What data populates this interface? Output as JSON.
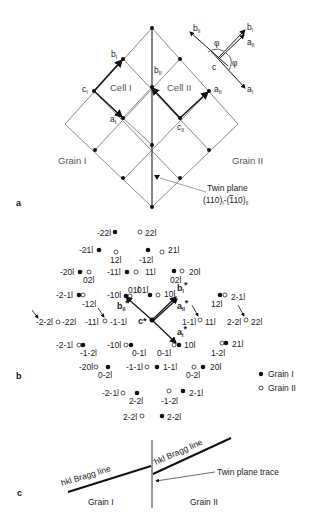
{
  "panel_a": {
    "label": "a",
    "cell_labels": [
      "Cell I",
      "Cell II"
    ],
    "grain_labels": [
      "Grain I",
      "Grain II"
    ],
    "vector_labels": {
      "bI": "b",
      "bII": "b",
      "cI": "c",
      "aI": "a",
      "aII": "a",
      "cII": "c"
    },
    "twin_plane_label": "Twin plane",
    "twin_plane_indices": "(110)I-(̄110)II",
    "inset": {
      "bII": "b",
      "bI": "b",
      "aII": "a",
      "aI": "a",
      "c": "c",
      "angle": "φ"
    }
  },
  "panel_b": {
    "label": "b",
    "legend": [
      {
        "symbol": "filled-circle",
        "label": "Grain I"
      },
      {
        "symbol": "open-circle",
        "label": "Grain II"
      }
    ],
    "spots": [
      {
        "label": "-22l",
        "x": 115,
        "y": 232,
        "grain": "I",
        "lx": 97,
        "ly": 236
      },
      {
        "label": "22l",
        "x": 140,
        "y": 232,
        "grain": "II",
        "lx": 145,
        "ly": 236
      },
      {
        "label": "-21l",
        "x": 99,
        "y": 250,
        "grain": "I",
        "lx": 79,
        "ly": 253
      },
      {
        "label": "12l",
        "x": 116,
        "y": 252,
        "grain": "II",
        "lx": 110,
        "ly": 263
      },
      {
        "label": "-12l",
        "x": 148,
        "y": 250,
        "grain": "I",
        "lx": 139,
        "ly": 263
      },
      {
        "label": "21l",
        "x": 162,
        "y": 252,
        "grain": "II",
        "lx": 168,
        "ly": 253
      },
      {
        "label": "-20l",
        "x": 80,
        "y": 272,
        "grain": "I",
        "lx": 60,
        "ly": 275
      },
      {
        "label": "02l",
        "x": 89,
        "y": 272,
        "grain": "II",
        "lx": 83,
        "ly": 283
      },
      {
        "label": "-11l",
        "x": 127,
        "y": 272,
        "grain": "I",
        "lx": 107,
        "ly": 275
      },
      {
        "label": "11l",
        "x": 136,
        "y": 272,
        "grain": "II",
        "lx": 145,
        "ly": 275
      },
      {
        "label": "20l",
        "x": 174,
        "y": 271,
        "grain": "I",
        "lx": 189,
        "ly": 275
      },
      {
        "label": "02l",
        "x": 182,
        "y": 271,
        "grain": "II",
        "lx": 170,
        "ly": 283
      },
      {
        "label": "-2-1l",
        "x": 79,
        "y": 295,
        "grain": "I",
        "lx": 56,
        "ly": 298
      },
      {
        "label": "-10l",
        "x": 126,
        "y": 296,
        "grain": "I",
        "lx": 107,
        "ly": 298
      },
      {
        "label": "01l",
        "x": 130,
        "y": 296,
        "grain": "II",
        "lx": 137,
        "ly": 293
      },
      {
        "label": "01l",
        "x": 150,
        "y": 295,
        "grain": "I",
        "lx": 128,
        "ly": 293
      },
      {
        "label": "10l",
        "x": 158,
        "y": 295,
        "grain": "II",
        "lx": 164,
        "ly": 297
      },
      {
        "label": "12l",
        "x": 220,
        "y": 295,
        "grain": "I",
        "lx": 211,
        "ly": 307
      },
      {
        "label": "2-1l",
        "x": 225,
        "y": 295,
        "grain": "II",
        "lx": 231,
        "ly": 300
      },
      {
        "label": "-12l",
        "x": 83,
        "y": 295,
        "grain": "II",
        "lx": 82,
        "ly": 307
      },
      {
        "label": "-2-2l",
        "x": 58,
        "y": 322,
        "grain": "II",
        "lx": 36,
        "ly": 325
      },
      {
        "label": "-22l",
        "x": 58,
        "y": 322,
        "grain": "II",
        "lx": 62,
        "ly": 325
      },
      {
        "label": "-11l",
        "x": 105,
        "y": 321,
        "grain": "II",
        "lx": 85,
        "ly": 325
      },
      {
        "label": "-1-1l",
        "x": 105,
        "y": 321,
        "grain": "II",
        "lx": 110,
        "ly": 325
      },
      {
        "label": "1-1l",
        "x": 200,
        "y": 320,
        "grain": "II",
        "lx": 182,
        "ly": 325
      },
      {
        "label": "11l",
        "x": 200,
        "y": 320,
        "grain": "II",
        "lx": 205,
        "ly": 325
      },
      {
        "label": "2-2l",
        "x": 246,
        "y": 320,
        "grain": "II",
        "lx": 227,
        "ly": 325
      },
      {
        "label": "22l",
        "x": 246,
        "y": 320,
        "grain": "II",
        "lx": 251,
        "ly": 325
      },
      {
        "label": "-2-1l",
        "x": 79,
        "y": 345,
        "grain": "II",
        "lx": 56,
        "ly": 348
      },
      {
        "label": "-1-2l",
        "x": 83,
        "y": 345,
        "grain": "I",
        "lx": 80,
        "ly": 356
      },
      {
        "label": "-10l",
        "x": 126,
        "y": 345,
        "grain": "II",
        "lx": 107,
        "ly": 348
      },
      {
        "label": "0-1l",
        "x": 131,
        "y": 345,
        "grain": "I",
        "lx": 132,
        "ly": 356
      },
      {
        "label": "0-1l",
        "x": 174,
        "y": 345,
        "grain": "II",
        "lx": 157,
        "ly": 356
      },
      {
        "label": "10l",
        "x": 179,
        "y": 345,
        "grain": "I",
        "lx": 184,
        "ly": 348
      },
      {
        "label": "1-2l",
        "x": 222,
        "y": 343,
        "grain": "II",
        "lx": 211,
        "ly": 356
      },
      {
        "label": "21l",
        "x": 226,
        "y": 343,
        "grain": "I",
        "lx": 232,
        "ly": 347
      },
      {
        "label": "-20l",
        "x": 96,
        "y": 367,
        "grain": "II",
        "lx": 79,
        "ly": 370
      },
      {
        "label": "0-2l",
        "x": 108,
        "y": 367,
        "grain": "I",
        "lx": 98,
        "ly": 378
      },
      {
        "label": "-1-1l",
        "x": 147,
        "y": 367,
        "grain": "II",
        "lx": 126,
        "ly": 370
      },
      {
        "label": "1-1l",
        "x": 157,
        "y": 367,
        "grain": "I",
        "lx": 163,
        "ly": 370
      },
      {
        "label": "0-2l",
        "x": 194,
        "y": 367,
        "grain": "II",
        "lx": 186,
        "ly": 378
      },
      {
        "label": "20l",
        "x": 203,
        "y": 367,
        "grain": "I",
        "lx": 210,
        "ly": 370
      },
      {
        "label": "-2-1l",
        "x": 123,
        "y": 393,
        "grain": "II",
        "lx": 102,
        "ly": 396
      },
      {
        "label": "2-2l",
        "x": 137,
        "y": 393,
        "grain": "I",
        "lx": 129,
        "ly": 404
      },
      {
        "label": "-1-2l",
        "x": 169,
        "y": 391,
        "grain": "II",
        "lx": 161,
        "ly": 404
      },
      {
        "label": "2-1l",
        "x": 183,
        "y": 391,
        "grain": "I",
        "lx": 189,
        "ly": 396
      },
      {
        "label": "2-2l",
        "x": 142,
        "y": 416,
        "grain": "II",
        "lx": 123,
        "ly": 420
      },
      {
        "label": "2-2l",
        "x": 162,
        "y": 416,
        "grain": "I",
        "lx": 167,
        "ly": 420
      }
    ],
    "reciprocal_labels": {
      "bI": "b*",
      "bII": "b*",
      "aI": "a*",
      "aII": "a*",
      "c": "c*"
    }
  },
  "panel_c": {
    "label": "c",
    "bragg_line_left": "hkl Bragg line",
    "bragg_line_right": "̄hkl Bragg line",
    "twin_plane_trace": "Twin plane trace",
    "grain_labels": [
      "Grain I",
      "Grain II"
    ]
  }
}
